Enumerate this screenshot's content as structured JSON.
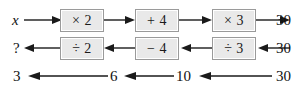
{
  "figure": {
    "colors": {
      "box_fill": "#e9e9e9",
      "box_border": "#9a9a9a",
      "arrow": "#1a1a1a",
      "background": "#ffffff"
    },
    "rows": [
      {
        "name": "forward-row",
        "direction": "right",
        "start_label": "x",
        "end_label": "30",
        "boxes": [
          {
            "label": "× 2"
          },
          {
            "label": "+ 4"
          },
          {
            "label": "× 3"
          }
        ]
      },
      {
        "name": "inverse-row",
        "direction": "left",
        "start_label": "?",
        "end_label": "30",
        "boxes": [
          {
            "label": "÷ 2"
          },
          {
            "label": "− 4"
          },
          {
            "label": "÷ 3"
          }
        ]
      },
      {
        "name": "values-row",
        "direction": "left",
        "labels": [
          "3",
          "6",
          "10",
          "30"
        ]
      }
    ]
  }
}
